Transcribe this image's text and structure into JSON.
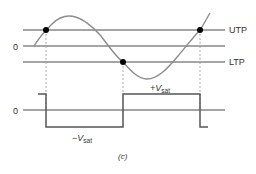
{
  "figure": {
    "caption": "(c)",
    "colors": {
      "axis_line": "#4a4a4a",
      "sine_curve": "#8c8c8c",
      "square_wave": "#555555",
      "dashed_guide": "#9a9a9a",
      "dot": "#000000",
      "text": "#333333"
    }
  },
  "top_plot": {
    "zero_label": "0",
    "upper_threshold_label": "UTP",
    "lower_threshold_label": "LTP",
    "crossing_points": [
      {
        "name": "utp-crossing-rising-1",
        "x": 46,
        "y": 30
      },
      {
        "name": "ltp-crossing-falling",
        "x": 123,
        "y": 62
      },
      {
        "name": "utp-crossing-rising-2",
        "x": 200,
        "y": 30
      }
    ]
  },
  "bottom_plot": {
    "zero_label": "0",
    "positive_saturation_label": {
      "main": "+V",
      "sub": "sat"
    },
    "negative_saturation_label": {
      "main": "−V",
      "sub": "sat"
    }
  }
}
